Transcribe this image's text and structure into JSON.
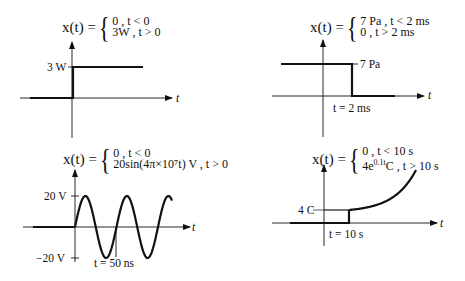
{
  "panels": [
    {
      "id": "a",
      "equation": {
        "lhs": "x(t) =",
        "case1": "0    ,  t < 0",
        "case2": "3W ,  t > 0"
      },
      "axis_label": "t",
      "ytick_labels": [
        "3 W"
      ],
      "xtick_labels": []
    },
    {
      "id": "b",
      "equation": {
        "lhs": "x(t) =",
        "case1": "7 Pa  ,  t < 2 ms",
        "case2": "0       ,  t > 2 ms"
      },
      "axis_label": "t",
      "ytick_labels": [
        "7 Pa"
      ],
      "xtick_labels": [
        "t = 2 ms"
      ]
    },
    {
      "id": "c",
      "equation": {
        "lhs": "x(t) =",
        "case1": "0  ,  t < 0",
        "case2": "20sin(4π×10⁷t) V , t > 0"
      },
      "axis_label": "t",
      "ytick_labels": [
        "20 V",
        "−20 V"
      ],
      "xtick_labels": [
        "t = 50 ns"
      ]
    },
    {
      "id": "d",
      "equation": {
        "lhs": "x(t) =",
        "case1": "0              , t < 10 s",
        "case2": "4e^{0.1t}C , t > 10 s",
        "case2_base": "4e",
        "case2_exp": "0.1t",
        "case2_tail": "C , t > 10 s"
      },
      "axis_label": "t",
      "ytick_labels": [
        "4 C"
      ],
      "xtick_labels": [
        "t = 10 s"
      ]
    }
  ],
  "chart_data": [
    {
      "type": "line",
      "title": "x(t) = {0, t<0; 3W, t>0}",
      "xlabel": "t",
      "ylabel": "x(t)",
      "x": [
        "t<0",
        "0",
        "t>0"
      ],
      "values": [
        0,
        3,
        3
      ],
      "units": "W"
    },
    {
      "type": "line",
      "title": "x(t) = {7 Pa, t<2 ms; 0, t>2 ms}",
      "xlabel": "t",
      "ylabel": "x(t)",
      "x": [
        "t<2 ms",
        "2 ms",
        "t>2 ms"
      ],
      "values": [
        7,
        0,
        0
      ],
      "units": "Pa"
    },
    {
      "type": "line",
      "title": "x(t) = {0, t<0; 20sin(4π×10⁷t) V, t>0}",
      "xlabel": "t",
      "ylabel": "x(t)",
      "amplitude": 20,
      "period_ns": 50,
      "units": "V",
      "yticks": [
        20,
        -20
      ],
      "xticks": [
        "50 ns"
      ]
    },
    {
      "type": "line",
      "title": "x(t) = {0, t<10 s; 4e^{0.1t} C, t>10 s}",
      "xlabel": "t",
      "ylabel": "x(t)",
      "step_at": "10 s",
      "step_value": 4,
      "units": "C",
      "shape": "exponential growth"
    }
  ]
}
